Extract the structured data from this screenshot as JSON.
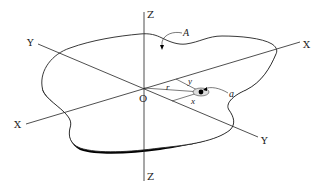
{
  "diagram": {
    "colors": {
      "background": "#ffffff",
      "line": "#222222",
      "shadow": "#000000"
    },
    "axes": {
      "x_neg_label": "X",
      "x_pos_label": "X",
      "y_pos_label": "Y",
      "y_neg_label": "Y",
      "z_pos_label": "Z",
      "z_neg_label": "Z"
    },
    "origin_label": "O",
    "area_label": "A",
    "element_label": "a",
    "radius_label": "r",
    "x_coord_label": "x",
    "y_coord_label": "y"
  }
}
